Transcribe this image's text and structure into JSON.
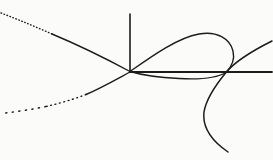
{
  "figure": {
    "width": 273,
    "height": 160,
    "background": "#fbfbfa",
    "stroke_color": "#1c1c1c",
    "node_point": {
      "x": 130,
      "y": 71.5
    },
    "axis_crossing_point": {
      "x": 226,
      "y": 72.5
    },
    "strokes": [
      {
        "name": "y-axis",
        "d": "M 130,14 L 130,71.5",
        "width": 1.6,
        "dash": null
      },
      {
        "name": "x-axis",
        "d": "M 130,72 L 272,72",
        "width": 1.8,
        "dash": null
      },
      {
        "name": "curve-upper-left-branch-solid",
        "d": "M 52,34 C 76,44 103,57 130,71.5",
        "width": 1.4,
        "dash": null
      },
      {
        "name": "curve-upper-left-branch-dotted",
        "d": "M 1,13 C 18,19.5 35,26.5 52,34",
        "width": 1.4,
        "dash": "0.6 2.6"
      },
      {
        "name": "curve-lower-left-branch-solid",
        "d": "M 130,72 C 116,79.5 101,88 86,94.5",
        "width": 1.4,
        "dash": null
      },
      {
        "name": "curve-lower-left-branch-dots-near",
        "d": "M 86,94.5 C 73,99.5 59,103.5 46,106.5",
        "width": 1.4,
        "dash": "0.9 3.6"
      },
      {
        "name": "curve-lower-left-branch-dots-far",
        "d": "M 46,106.5 C 32,109.5 18,111.5 5,113",
        "width": 1.5,
        "dash": "1.1 5.5"
      },
      {
        "name": "curve-loop",
        "d": "M 130,71.5 C 152,56 177,38 199,34 C 217,30.5 230,39 233,51 C 235,59.5 232,66.5 226,72.5 C 215,79 196,79.5 179,78.5 C 159,77.5 141,74.8 130,71.5 Z",
        "width": 1.4,
        "dash": null
      },
      {
        "name": "curve-right-branch",
        "d": "M 272,41 C 257,48.5 237,59 226,72.5 C 214,87 206,100 204,112 C 202.5,125 209,139 228,152",
        "width": 1.5,
        "dash": null
      }
    ]
  }
}
